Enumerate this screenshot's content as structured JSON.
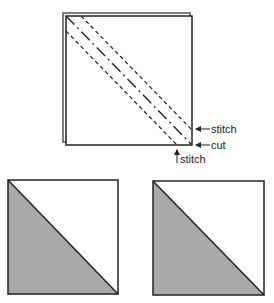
{
  "diagram": {
    "top_panel": {
      "description": "Two stacked fabric squares with diagonal stitch and cut lines",
      "labels": {
        "upper_stitch": "stitch",
        "cut": "cut",
        "lower_stitch": "stitch"
      },
      "line_styles": {
        "stitch": "dashed",
        "cut": "dash-dot"
      }
    },
    "bottom_panel": {
      "description": "Two resulting half-square triangle units",
      "units": [
        {
          "name": "left-unit",
          "shaded": "lower-left triangle"
        },
        {
          "name": "right-unit",
          "shaded": "lower-left triangle"
        }
      ]
    },
    "colors": {
      "background": "#ffffff",
      "outline": "#222222",
      "shading": "#a9a9a9",
      "back_layer": "#555555"
    }
  }
}
